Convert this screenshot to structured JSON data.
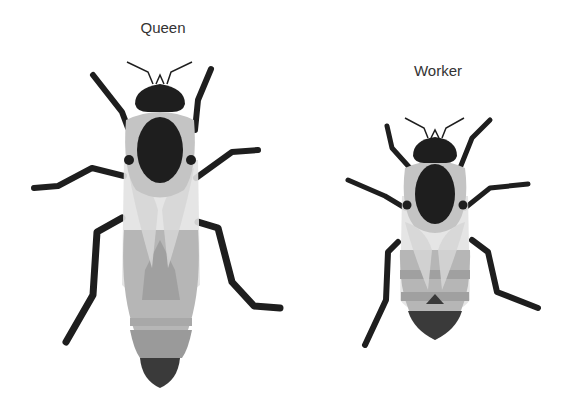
{
  "figure": {
    "bees": [
      {
        "label": "Queen"
      },
      {
        "label": "Worker"
      }
    ],
    "colors": {
      "body_dark": "#1e1e1e",
      "thorax_fuzz": "#c4c4c4",
      "wing": "#e2e2e2",
      "abdomen_light": "#b6b6b6",
      "abdomen_mid": "#9a9a9a",
      "abdomen_dark": "#3a3a3a"
    }
  }
}
